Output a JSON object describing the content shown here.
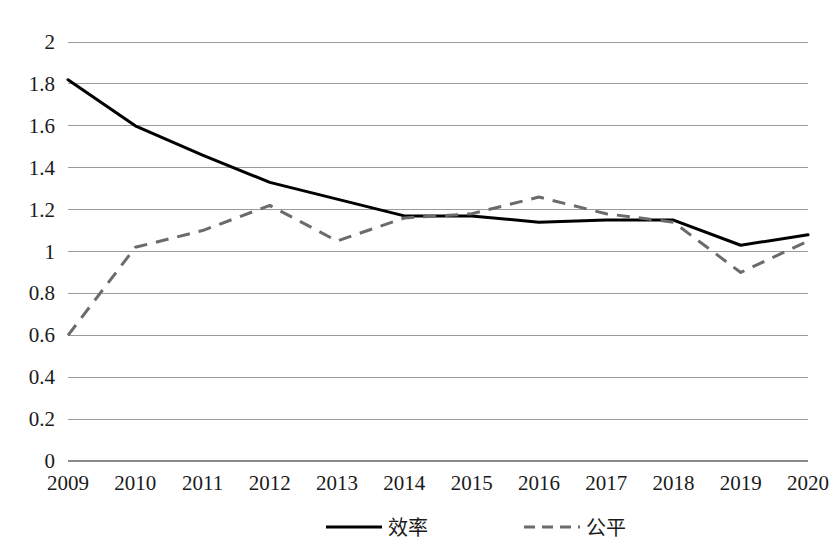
{
  "chart_data": {
    "type": "line",
    "title": "",
    "subtitle": "",
    "xlabel": "",
    "ylabel": "",
    "categories": [
      "2009",
      "2010",
      "2011",
      "2012",
      "2013",
      "2014",
      "2015",
      "2016",
      "2017",
      "2018",
      "2019",
      "2020"
    ],
    "ylim": [
      0,
      2
    ],
    "ytick_labels": [
      "2",
      "1.8",
      "1.6",
      "1.4",
      "1.2",
      "1",
      "0.8",
      "0.6",
      "0.4",
      "0.2",
      "0"
    ],
    "ytick_values": [
      2,
      1.8,
      1.6,
      1.4,
      1.2,
      1.0,
      0.8,
      0.6,
      0.4,
      0.2,
      0
    ],
    "grid": "horizontal",
    "legend_position": "bottom",
    "series": [
      {
        "name": "效率",
        "style": "solid",
        "color": "#000000",
        "values": [
          1.82,
          1.6,
          1.46,
          1.33,
          1.25,
          1.17,
          1.17,
          1.14,
          1.15,
          1.15,
          1.03,
          1.08
        ]
      },
      {
        "name": "公平",
        "style": "dashed",
        "color": "#6b6b6b",
        "values": [
          0.6,
          1.02,
          1.1,
          1.22,
          1.05,
          1.16,
          1.18,
          1.26,
          1.18,
          1.14,
          0.9,
          1.05
        ]
      }
    ]
  },
  "legend": {
    "items": [
      {
        "label": "效率",
        "marker": "solid-line-swatch"
      },
      {
        "label": "公平",
        "marker": "dashed-line-swatch"
      }
    ]
  },
  "colors": {
    "background": "#ffffff",
    "gridline": "#9a9a9a",
    "axis_text": "#1a1a1a",
    "series_efficiency": "#000000",
    "series_equity": "#6b6b6b"
  }
}
